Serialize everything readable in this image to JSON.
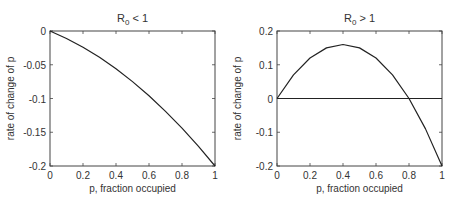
{
  "chart_data": [
    {
      "type": "line",
      "title": "R0 < 1",
      "title_main": "R",
      "title_sub": "0",
      "title_rest": " < 1",
      "xlabel": "p, fraction occupied",
      "ylabel": "rate of change of p",
      "xlim": [
        0,
        1
      ],
      "ylim": [
        -0.2,
        0
      ],
      "xticks": [
        0,
        0.2,
        0.4,
        0.6,
        0.8,
        1
      ],
      "xtick_labels": [
        "0",
        "0.2",
        "0.4",
        "0.6",
        "0.8",
        "1"
      ],
      "yticks": [
        0,
        -0.05,
        -0.1,
        -0.15,
        -0.2
      ],
      "ytick_labels": [
        "0",
        "-0.05",
        "-0.1",
        "-0.15",
        "-0.2"
      ],
      "grid": false,
      "series": [
        {
          "name": "dp/dt",
          "x": [
            0,
            0.1,
            0.2,
            0.3,
            0.4,
            0.5,
            0.6,
            0.7,
            0.8,
            0.9,
            1.0
          ],
          "y": [
            0,
            -0.011,
            -0.024,
            -0.039,
            -0.056,
            -0.075,
            -0.096,
            -0.119,
            -0.144,
            -0.171,
            -0.2
          ]
        }
      ],
      "box": {
        "left": 50,
        "top": 31,
        "right": 215,
        "bottom": 166
      }
    },
    {
      "type": "line",
      "title": "R0 > 1",
      "title_main": "R",
      "title_sub": "0",
      "title_rest": " > 1",
      "xlabel": "p, fraction occupied",
      "ylabel": "rate of change of p",
      "xlim": [
        0,
        1
      ],
      "ylim": [
        -0.2,
        0.2
      ],
      "xticks": [
        0,
        0.2,
        0.4,
        0.6,
        0.8,
        1
      ],
      "xtick_labels": [
        "0",
        "0.2",
        "0.4",
        "0.6",
        "0.8",
        "1"
      ],
      "yticks": [
        0.2,
        0.1,
        0,
        -0.1,
        -0.2
      ],
      "ytick_labels": [
        "0.2",
        "0.1",
        "0",
        "-0.1",
        "-0.2"
      ],
      "grid": false,
      "reference_line": {
        "y": 0
      },
      "series": [
        {
          "name": "dp/dt",
          "x": [
            0,
            0.1,
            0.2,
            0.3,
            0.4,
            0.5,
            0.6,
            0.7,
            0.8,
            0.9,
            1.0
          ],
          "y": [
            0,
            0.07,
            0.12,
            0.15,
            0.16,
            0.15,
            0.12,
            0.07,
            0,
            -0.09,
            -0.2
          ]
        }
      ],
      "box": {
        "left": 277,
        "top": 31,
        "right": 442,
        "bottom": 166
      }
    }
  ],
  "colors": {
    "line": "#222222",
    "axes": "#444444",
    "text": "#333333"
  }
}
